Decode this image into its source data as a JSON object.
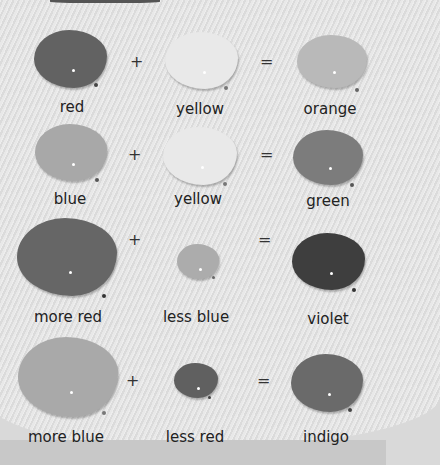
{
  "rows": [
    {
      "left": {
        "label": "red",
        "color": "#626262"
      },
      "op1": "+",
      "mid": {
        "label": "yellow",
        "color": "#e9e9e9"
      },
      "op2": "=",
      "right": {
        "label": "orange",
        "color": "#b9b9b9"
      }
    },
    {
      "left": {
        "label": "blue",
        "color": "#a8a8a8"
      },
      "op1": "+",
      "mid": {
        "label": "yellow",
        "color": "#e9e9e9"
      },
      "op2": "=",
      "right": {
        "label": "green",
        "color": "#7c7c7c"
      }
    },
    {
      "left": {
        "label": "more red",
        "color": "#666666"
      },
      "op1": "+",
      "mid": {
        "label": "less blue",
        "color": "#acacac"
      },
      "op2": "=",
      "right": {
        "label": "violet",
        "color": "#3e3e3e"
      }
    },
    {
      "left": {
        "label": "more blue",
        "color": "#a9a9a9"
      },
      "op1": "+",
      "mid": {
        "label": "less red",
        "color": "#606060"
      },
      "op2": "=",
      "right": {
        "label": "indigo",
        "color": "#6a6a6a"
      }
    }
  ]
}
